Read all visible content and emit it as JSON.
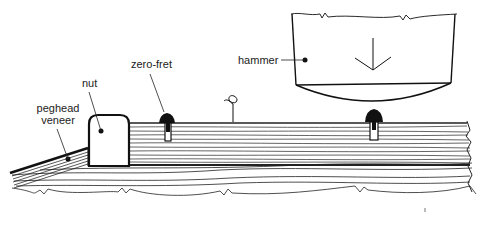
{
  "diagram": {
    "type": "technical illustration",
    "labels": {
      "peghead_veneer_line1": "peghead",
      "peghead_veneer_line2": "veneer",
      "nut": "nut",
      "zero_fret": "zero-fret",
      "hammer": "hammer"
    },
    "colors": {
      "ink": "#111111",
      "background": "#ffffff",
      "grain": "#333333"
    }
  }
}
